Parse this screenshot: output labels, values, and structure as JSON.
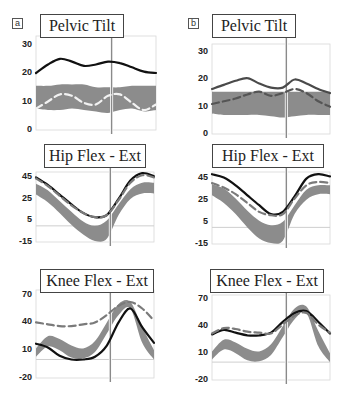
{
  "panels": [
    {
      "letter": "a"
    },
    {
      "letter": "b"
    }
  ],
  "chart_data": [
    {
      "panel": "a",
      "type": "line",
      "title": "Pelvic Tilt",
      "yticks": [
        "30",
        "20",
        "10",
        "0"
      ],
      "ylim": [
        0,
        33
      ],
      "x": [
        0,
        10,
        20,
        30,
        40,
        50,
        60,
        70,
        80,
        90,
        100
      ],
      "series": [
        {
          "name": "subject",
          "style": "solid-black",
          "values": [
            20,
            23,
            25,
            24,
            22.5,
            23,
            24,
            23.5,
            22,
            20.5,
            20
          ]
        },
        {
          "name": "comparison",
          "style": "dashed-gray",
          "values": [
            7.5,
            10,
            12.5,
            12,
            9.5,
            9,
            12,
            12.5,
            9.5,
            7,
            9
          ]
        },
        {
          "name": "normal-band-upper",
          "values": [
            15.5,
            15.5,
            16,
            16,
            16,
            15,
            15,
            15,
            15.5,
            15.5,
            15.5
          ]
        },
        {
          "name": "normal-band-lower",
          "values": [
            7.5,
            7,
            7,
            7.5,
            7,
            6.5,
            6,
            7,
            7.5,
            6.5,
            7
          ]
        }
      ],
      "toe_off_x": 63
    },
    {
      "panel": "b",
      "type": "line",
      "title": "Pelvic Tilt",
      "yticks": [
        "30",
        "20",
        "10",
        "0"
      ],
      "ylim": [
        0,
        33
      ],
      "x": [
        0,
        10,
        20,
        30,
        40,
        50,
        60,
        70,
        80,
        90,
        100
      ],
      "series": [
        {
          "name": "subject",
          "style": "solid-dark-gray",
          "values": [
            16.5,
            18,
            19.5,
            20.5,
            18.5,
            17,
            17,
            20,
            18.5,
            16.5,
            15
          ]
        },
        {
          "name": "comparison",
          "style": "dashed-dark",
          "values": [
            11,
            12,
            13,
            14.5,
            15.5,
            14,
            15,
            16.5,
            15,
            12,
            10
          ]
        },
        {
          "name": "normal-band-upper",
          "values": [
            15.5,
            15.5,
            15.5,
            15.5,
            15.5,
            15.5,
            15.5,
            15.5,
            15.5,
            15.5,
            15.5
          ]
        },
        {
          "name": "normal-band-lower",
          "values": [
            7.5,
            7,
            7,
            7,
            7,
            6.5,
            6,
            6.5,
            7,
            7,
            7
          ]
        }
      ],
      "toe_off_x": 63
    },
    {
      "panel": "a",
      "type": "line",
      "title": "Hip Flex - Ext",
      "yticks": [
        "45",
        "25",
        "5",
        "-15"
      ],
      "ylim": [
        -15,
        50
      ],
      "x": [
        0,
        10,
        20,
        30,
        40,
        50,
        60,
        70,
        80,
        90,
        100
      ],
      "series": [
        {
          "name": "subject",
          "style": "solid-black",
          "values": [
            45,
            38,
            29,
            20,
            12,
            8,
            10,
            25,
            42,
            49,
            46
          ]
        },
        {
          "name": "comparison",
          "style": "dashed-gray",
          "values": [
            44,
            37,
            28,
            19,
            12,
            8,
            10,
            24,
            40,
            47,
            45
          ]
        },
        {
          "name": "normal-band-upper",
          "values": [
            39,
            33,
            23,
            13,
            4,
            0,
            5,
            20,
            34,
            40,
            40
          ]
        },
        {
          "name": "normal-band-lower",
          "values": [
            29,
            22,
            12,
            1,
            -8,
            -14,
            -12,
            10,
            25,
            30,
            30
          ]
        }
      ],
      "toe_off_x": 63
    },
    {
      "panel": "b",
      "type": "line",
      "title": "Hip Flex - Ext",
      "yticks": [
        "45",
        "25",
        "5",
        "-15"
      ],
      "ylim": [
        -15,
        50
      ],
      "x": [
        0,
        10,
        20,
        30,
        40,
        50,
        60,
        70,
        80,
        90,
        100
      ],
      "series": [
        {
          "name": "subject",
          "style": "solid-black",
          "values": [
            48,
            45,
            38,
            29,
            20,
            12,
            14,
            28,
            44,
            48,
            46
          ]
        },
        {
          "name": "comparison",
          "style": "dashed-gray",
          "values": [
            40,
            36,
            30,
            22,
            14,
            11,
            12,
            26,
            38,
            41,
            40
          ]
        },
        {
          "name": "normal-band-upper",
          "values": [
            39,
            35,
            26,
            15,
            6,
            2,
            5,
            20,
            34,
            38,
            38
          ]
        },
        {
          "name": "normal-band-lower",
          "values": [
            29,
            22,
            12,
            0,
            -10,
            -14,
            -12,
            12,
            25,
            30,
            30
          ]
        }
      ],
      "toe_off_x": 63
    },
    {
      "panel": "a",
      "type": "line",
      "title": "Knee Flex - Ext",
      "yticks": [
        "70",
        "40",
        "10",
        "-20"
      ],
      "ylim": [
        -20,
        75
      ],
      "x": [
        0,
        10,
        20,
        30,
        40,
        50,
        60,
        70,
        80,
        90,
        100
      ],
      "series": [
        {
          "name": "subject",
          "style": "solid-black",
          "values": [
            17,
            13,
            4,
            0,
            0,
            3,
            15,
            40,
            55,
            35,
            18
          ]
        },
        {
          "name": "comparison",
          "style": "dashed-gray",
          "values": [
            40,
            38,
            36,
            36,
            38,
            40,
            48,
            58,
            62,
            55,
            42
          ]
        },
        {
          "name": "normal-band-upper",
          "values": [
            12,
            25,
            22,
            15,
            12,
            20,
            40,
            60,
            62,
            35,
            10
          ]
        },
        {
          "name": "normal-band-lower",
          "values": [
            3,
            14,
            10,
            2,
            1,
            8,
            28,
            48,
            55,
            18,
            0
          ]
        }
      ],
      "toe_off_x": 63
    },
    {
      "panel": "b",
      "type": "line",
      "title": "Knee Flex - Ext",
      "yticks": [
        "70",
        "40",
        "10",
        "-20"
      ],
      "ylim": [
        -20,
        75
      ],
      "x": [
        0,
        10,
        20,
        30,
        40,
        50,
        60,
        70,
        80,
        90,
        100
      ],
      "series": [
        {
          "name": "subject",
          "style": "solid-black",
          "values": [
            31,
            36,
            33,
            30,
            30,
            33,
            45,
            55,
            57,
            45,
            32
          ]
        },
        {
          "name": "comparison",
          "style": "dashed-gray",
          "values": [
            32,
            38,
            37,
            34,
            33,
            32,
            42,
            52,
            55,
            42,
            33
          ]
        },
        {
          "name": "normal-band-upper",
          "values": [
            12,
            25,
            22,
            15,
            12,
            20,
            40,
            60,
            62,
            35,
            10
          ]
        },
        {
          "name": "normal-band-lower",
          "values": [
            3,
            14,
            10,
            2,
            1,
            8,
            28,
            48,
            55,
            18,
            0
          ]
        }
      ],
      "toe_off_x": 63
    }
  ]
}
